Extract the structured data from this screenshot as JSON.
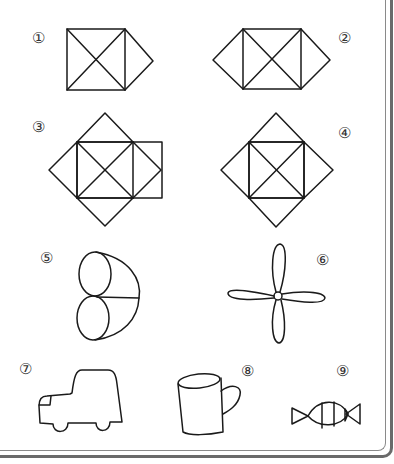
{
  "worksheet": {
    "figures": [
      {
        "id": 1,
        "label": "①",
        "shape": "square-with-diagonals-and-right-triangle"
      },
      {
        "id": 2,
        "label": "②",
        "shape": "square-with-diagonals-and-two-side-triangles"
      },
      {
        "id": 3,
        "label": "③",
        "shape": "square-with-diagonals-four-triangles-and-right-rectangle"
      },
      {
        "id": 4,
        "label": "④",
        "shape": "square-with-diagonals-and-four-triangles"
      },
      {
        "id": 5,
        "label": "⑤",
        "shape": "two-ellipses-with-half-disc"
      },
      {
        "id": 6,
        "label": "⑥",
        "shape": "four-petal-propeller"
      },
      {
        "id": 7,
        "label": "⑦",
        "shape": "car-outline"
      },
      {
        "id": 8,
        "label": "⑧",
        "shape": "mug-outline"
      },
      {
        "id": 9,
        "label": "⑨",
        "shape": "wrapped-candy-outline"
      }
    ],
    "colors": {
      "stroke": "#1a1a1a",
      "border": "#6a6a6a",
      "background": "#ffffff"
    }
  }
}
